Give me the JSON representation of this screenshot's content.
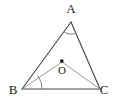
{
  "figure": {
    "kind": "geometry-diagram",
    "background_color": "#ffffff",
    "side_color": "#4a4a4a",
    "cevian_color": "#8d8d8d",
    "arc_color": "#6e6e6e",
    "label_color": "#1b1b1b",
    "labels": {
      "apex": "A",
      "bottom_left": "B",
      "bottom_right": "C",
      "interior_point": "O"
    },
    "points": {
      "A": {
        "x": 71,
        "y": 22
      },
      "B": {
        "x": 22,
        "y": 89
      },
      "C": {
        "x": 100,
        "y": 89
      },
      "O": {
        "x": 62,
        "y": 62
      }
    },
    "label_positions": {
      "A": {
        "x": 71,
        "y": 13
      },
      "B": {
        "x": 13,
        "y": 94
      },
      "C": {
        "x": 103,
        "y": 94
      },
      "O": {
        "x": 62,
        "y": 74
      }
    },
    "segments": [
      {
        "name": "AB",
        "from": "A",
        "to": "B",
        "style": "side"
      },
      {
        "name": "AC",
        "from": "A",
        "to": "C",
        "style": "side"
      },
      {
        "name": "BC",
        "from": "B",
        "to": "C",
        "style": "side"
      },
      {
        "name": "BO",
        "from": "B",
        "to": "O",
        "style": "cevian"
      },
      {
        "name": "OC",
        "from": "O",
        "to": "C",
        "style": "cevian"
      }
    ],
    "angle_marks": [
      {
        "name": "angle-A",
        "at": "A",
        "between": "AB and AC"
      },
      {
        "name": "angle-OBC",
        "at": "B",
        "between": "BO and BC"
      }
    ]
  }
}
